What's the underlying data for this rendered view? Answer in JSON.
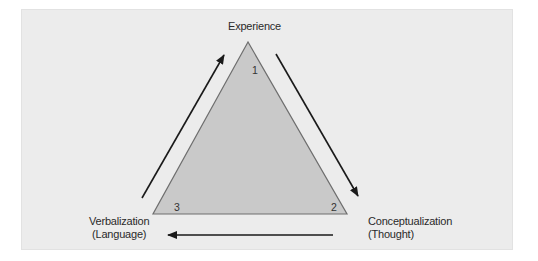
{
  "diagram": {
    "type": "cycle-triangle",
    "nodes": [
      {
        "id": 1,
        "label": "Experience",
        "sublabel": "",
        "number": "1"
      },
      {
        "id": 2,
        "label": "Conceptualization",
        "sublabel": "(Thought)",
        "number": "2"
      },
      {
        "id": 3,
        "label": "Verbalization",
        "sublabel": "(Language)",
        "number": "3"
      }
    ],
    "edges": [
      {
        "from": "Experience",
        "to": "Conceptualization",
        "direction": "clockwise"
      },
      {
        "from": "Conceptualization",
        "to": "Verbalization",
        "direction": "clockwise"
      },
      {
        "from": "Verbalization",
        "to": "Experience",
        "direction": "clockwise"
      }
    ],
    "colors": {
      "panel_background": "#ececec",
      "triangle_fill": "#c9c9c9",
      "triangle_stroke": "#6e6e6e",
      "arrow": "#1a1a1a",
      "text": "#2a2a2a"
    }
  },
  "labels": {
    "top": "Experience",
    "bottom_left_line1": "Verbalization",
    "bottom_left_line2": "(Language)",
    "bottom_right_line1": "Conceptualization",
    "bottom_right_line2": "(Thought)",
    "corner_top": "1",
    "corner_right": "2",
    "corner_left": "3"
  }
}
